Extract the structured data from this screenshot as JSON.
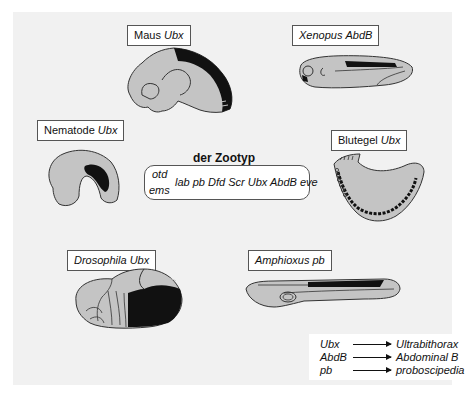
{
  "diagram": {
    "title": "der Zootyp",
    "zootyp_genes": {
      "top_left": "otd",
      "bottom_left": "ems",
      "main_row": "lab pb Dfd Scr Ubx AbdB eve"
    },
    "organisms": [
      {
        "name": "Maus",
        "gene": "Ubx"
      },
      {
        "name": "Xenopus",
        "gene": "AbdB",
        "name_italic": true
      },
      {
        "name": "Nematode",
        "gene": "Ubx"
      },
      {
        "name": "Blutegel",
        "gene": "Ubx"
      },
      {
        "name": "Drosophila",
        "gene": "Ubx",
        "name_italic": true
      },
      {
        "name": "Amphioxus",
        "gene": "pb",
        "name_italic": true
      }
    ],
    "legend": [
      {
        "abbr": "Ubx",
        "full": "Ultrabithorax"
      },
      {
        "abbr": "AbdB",
        "full": "Abdominal B"
      },
      {
        "abbr": "pb",
        "full": "proboscipedia"
      }
    ],
    "colors": {
      "background": "#f1f1f1",
      "body_fill": "#c4c4c4",
      "expression": "#111111",
      "outline": "#333333"
    }
  }
}
